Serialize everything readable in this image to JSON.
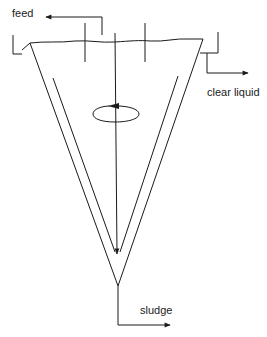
{
  "diagram": {
    "type": "thickener-clarifier schematic",
    "labels": {
      "feed": "feed",
      "clear_liquid": "clear liquid",
      "sludge": "sludge"
    },
    "streams": [
      {
        "name": "feed",
        "direction": "in"
      },
      {
        "name": "clear liquid",
        "direction": "out"
      },
      {
        "name": "sludge",
        "direction": "out"
      }
    ],
    "components": [
      "conical vessel",
      "inner cone",
      "central rotating shaft",
      "rotation indicator",
      "overflow weirs",
      "baffles"
    ],
    "colors": {
      "line": "#1a1a1a",
      "background": "#ffffff"
    }
  }
}
